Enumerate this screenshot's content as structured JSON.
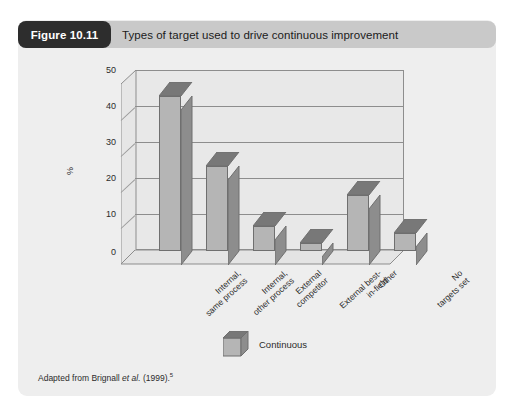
{
  "figure": {
    "number_label": "Figure 10.11",
    "title": "Types of target used to drive continuous improvement",
    "source_note_prefix": "Adapted from Brignall ",
    "source_note_italic": "et al.",
    "source_note_suffix": " (1999).",
    "source_note_superscript": "5"
  },
  "legend": {
    "items": [
      {
        "label": "Continuous",
        "swatch_name": "continuous-3d-cube-swatch",
        "color": "#b5b5b5"
      }
    ]
  },
  "colors": {
    "page_background": "#ffffff",
    "figure_background": "#eeeeee",
    "header_bar": "#c9c9c9",
    "badge_background": "#2d2d2d",
    "badge_text": "#ffffff",
    "plot_background": "#e8e8e8",
    "axis_line": "#8d8d8d",
    "bar_front": "#b5b5b5",
    "bar_side": "#8d8d8d",
    "bar_top": "#787878",
    "bar_outline": "#6f6f6f",
    "text": "#2b2b2b"
  },
  "chart_data": {
    "type": "bar",
    "title": "Types of target used to drive continuous improvement",
    "xlabel": "",
    "ylabel": "%",
    "ylim": [
      0,
      50
    ],
    "yticks": [
      0,
      10,
      20,
      30,
      40,
      50
    ],
    "ytick_labels": [
      "0",
      "10",
      "20",
      "30",
      "40",
      "50"
    ],
    "grid": true,
    "legend_position": "bottom-center",
    "style_3d": true,
    "categories": [
      "Internal, same process",
      "Internal, other process",
      "External competitor",
      "External best-in-field",
      "Other",
      "No targets set"
    ],
    "series": [
      {
        "name": "Continuous",
        "values": [
          43,
          23.5,
          7,
          2,
          15.5,
          5
        ]
      }
    ]
  }
}
